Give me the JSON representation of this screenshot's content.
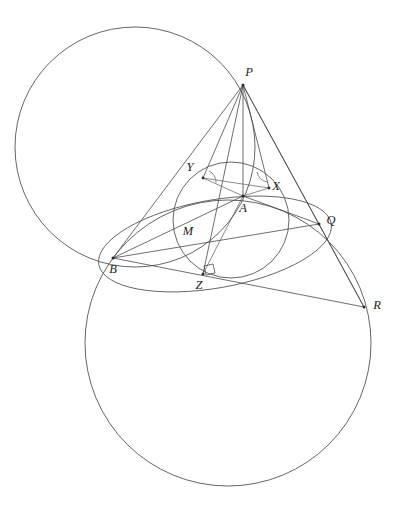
{
  "figure": {
    "background_color": "#ffffff",
    "stroke_color": "#4a4a4a",
    "label_color": "#1c1c1c",
    "width": 403,
    "height": 516
  },
  "labels": {
    "P": "P",
    "Q": "Q",
    "R": "R",
    "A": "A",
    "B": "B",
    "M": "M",
    "X": "X",
    "Y": "Y",
    "Z": "Z"
  },
  "points": [
    {
      "id": "P",
      "label": "P",
      "x": 243,
      "y": 85,
      "label_x": 249,
      "label_y": 73,
      "dot": true
    },
    {
      "id": "Q",
      "label": "Q",
      "x": 319,
      "y": 224,
      "label_x": 331,
      "label_y": 221,
      "dot": true
    },
    {
      "id": "R",
      "label": "R",
      "x": 364,
      "y": 307,
      "label_x": 377,
      "label_y": 306,
      "dot": true
    },
    {
      "id": "A",
      "label": "A",
      "x": 243,
      "y": 196,
      "label_x": 243,
      "label_y": 209,
      "dot": true
    },
    {
      "id": "B",
      "label": "B",
      "x": 113,
      "y": 258,
      "label_x": 113,
      "label_y": 270,
      "dot": true
    },
    {
      "id": "M",
      "label": "M",
      "x": 190,
      "y": 226,
      "label_x": 188,
      "label_y": 232,
      "dot": false
    },
    {
      "id": "X",
      "label": "X",
      "x": 269,
      "y": 188,
      "label_x": 276,
      "label_y": 187,
      "dot": true
    },
    {
      "id": "Y",
      "label": "Y",
      "x": 203,
      "y": 178,
      "label_x": 190,
      "label_y": 168,
      "dot": true
    },
    {
      "id": "Z",
      "label": "Z",
      "x": 203,
      "y": 274,
      "label_x": 199,
      "label_y": 286,
      "dot": true
    }
  ],
  "circles": [
    {
      "id": "upper-large-circle",
      "name": "circumcircle-upper",
      "cx": 135,
      "cy": 147,
      "r": 120
    },
    {
      "id": "lower-large-circle",
      "name": "circumcircle-lower",
      "cx": 228,
      "cy": 343,
      "r": 143
    },
    {
      "id": "incircle",
      "name": "incircle",
      "cx": 231,
      "cy": 220,
      "r": 58
    }
  ],
  "ellipses": [
    {
      "id": "arc-bmz-q",
      "name": "circle-through-b-m-z-q",
      "cx": 215,
      "cy": 244,
      "rx": 118,
      "ry": 44,
      "rotation": -10
    }
  ],
  "segments": [
    {
      "id": "seg-PB",
      "from": "P",
      "to": "B"
    },
    {
      "id": "seg-PZ",
      "from": "P",
      "to": "Z"
    },
    {
      "id": "seg-PX",
      "from": "P",
      "to": "X"
    },
    {
      "id": "seg-PQ",
      "from": "P",
      "to": "Q"
    },
    {
      "id": "seg-PR",
      "from": "P",
      "to": "R"
    },
    {
      "id": "seg-PA",
      "from": "P",
      "to": "A"
    },
    {
      "id": "seg-PY",
      "from": "P",
      "to": "Y"
    },
    {
      "id": "seg-BR",
      "from": "B",
      "to": "R"
    },
    {
      "id": "seg-BQ",
      "from": "B",
      "to": "Q"
    },
    {
      "id": "seg-BA",
      "from": "B",
      "to": "A"
    },
    {
      "id": "seg-YX",
      "from": "Y",
      "to": "X"
    },
    {
      "id": "seg-YA",
      "from": "Y",
      "to": "A"
    },
    {
      "id": "seg-AX",
      "from": "A",
      "to": "X"
    },
    {
      "id": "seg-AQ",
      "from": "A",
      "to": "Q"
    },
    {
      "id": "seg-QR",
      "from": "Q",
      "to": "R"
    },
    {
      "id": "seg-AZ",
      "from": "A",
      "to": "Z"
    }
  ],
  "markers": {
    "right_angle_at": "Z",
    "angle_arc_at_Y": true,
    "angle_arc_at_X": true
  }
}
